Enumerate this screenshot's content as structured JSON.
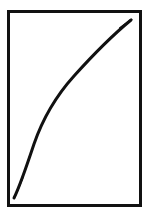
{
  "figure": {
    "title": "",
    "canvas": {
      "width": 150,
      "height": 220,
      "background": "#ffffff"
    },
    "frame": {
      "name": "plot-frame",
      "x": 8.5,
      "y": 11.5,
      "width": 132,
      "height": 194,
      "stroke_color": "#111111",
      "stroke_width": 3,
      "fill_color": "#ffffff"
    },
    "curve": {
      "name": "growth-curve",
      "stroke_color": "#111111",
      "stroke_width_start": 1.2,
      "stroke_width_mid": 3.0,
      "stroke_width_end": 1.6,
      "path": "M 14 198 C 19 188 26 168 34 144 C 43 118 56 96 74 76 C 92 56 114 34 131 20",
      "shape": "concave-down increasing curve"
    }
  },
  "chart_data": {
    "type": "line",
    "title": "",
    "xlabel": "",
    "ylabel": "",
    "xlim": [
      8.5,
      140.5
    ],
    "ylim": [
      11.5,
      205.5
    ],
    "grid": false,
    "legend": null,
    "axis_ticks": {
      "x": [],
      "y": []
    },
    "series": [
      {
        "name": "curve",
        "color": "#111111",
        "points_pixel": [
          {
            "x": 14,
            "y": 198
          },
          {
            "x": 22,
            "y": 180
          },
          {
            "x": 33,
            "y": 140
          },
          {
            "x": 52,
            "y": 103
          },
          {
            "x": 78,
            "y": 71
          },
          {
            "x": 105,
            "y": 44
          },
          {
            "x": 132,
            "y": 20
          }
        ]
      }
    ]
  }
}
